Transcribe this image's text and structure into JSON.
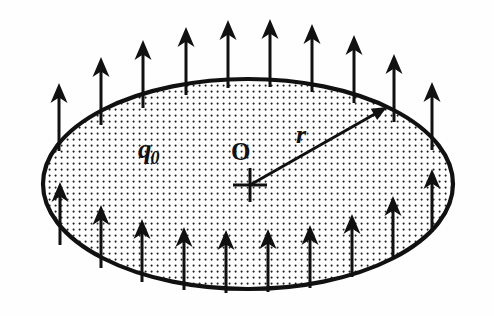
{
  "figure": {
    "domain": "Diagram",
    "background_color": "#fefefe",
    "ink_color": "#111111",
    "labels": {
      "charge": "q",
      "charge_subscript": "0",
      "center": "O",
      "radius": "r"
    },
    "shape": {
      "type": "ellipse",
      "center_x": 248,
      "center_y": 184,
      "radius_x": 206,
      "radius_y": 106,
      "stroke_width": 4,
      "fill_pattern": "dot-grid",
      "dot_spacing": 6,
      "dot_radius": 1.1
    },
    "center_marker": {
      "type": "plus-cross",
      "x": 250,
      "y": 185,
      "arm_length": 17,
      "stroke_width": 3
    },
    "radius_vector": {
      "from_x": 250,
      "from_y": 185,
      "to_x": 387,
      "to_y": 107,
      "stroke_width": 3,
      "head_length": 15,
      "head_width": 13
    },
    "field_arrows": {
      "shaft_width": 3,
      "head_length": 20,
      "head_width": 17,
      "length": 68,
      "top": [
        {
          "x": 59,
          "base_y": 151,
          "tip_y": 83
        },
        {
          "x": 101,
          "base_y": 125,
          "tip_y": 57
        },
        {
          "x": 143,
          "base_y": 108,
          "tip_y": 40
        },
        {
          "x": 186,
          "base_y": 95,
          "tip_y": 27
        },
        {
          "x": 228,
          "base_y": 88,
          "tip_y": 20
        },
        {
          "x": 270,
          "base_y": 87,
          "tip_y": 19
        },
        {
          "x": 312,
          "base_y": 92,
          "tip_y": 24
        },
        {
          "x": 354,
          "base_y": 103,
          "tip_y": 35
        },
        {
          "x": 394,
          "base_y": 122,
          "tip_y": 54
        },
        {
          "x": 432,
          "base_y": 150,
          "tip_y": 82
        }
      ],
      "bottom": [
        {
          "x": 60,
          "base_y": 245,
          "tip_y": 182
        },
        {
          "x": 101,
          "base_y": 268,
          "tip_y": 205
        },
        {
          "x": 142,
          "base_y": 282,
          "tip_y": 219
        },
        {
          "x": 184,
          "base_y": 290,
          "tip_y": 227
        },
        {
          "x": 226,
          "base_y": 293,
          "tip_y": 230
        },
        {
          "x": 268,
          "base_y": 292,
          "tip_y": 229
        },
        {
          "x": 310,
          "base_y": 288,
          "tip_y": 225
        },
        {
          "x": 352,
          "base_y": 277,
          "tip_y": 214
        },
        {
          "x": 393,
          "base_y": 259,
          "tip_y": 196
        },
        {
          "x": 432,
          "base_y": 232,
          "tip_y": 169
        }
      ]
    }
  }
}
